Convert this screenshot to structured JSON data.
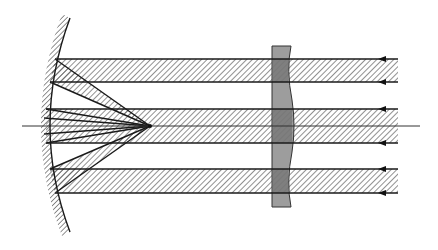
{
  "diagram": {
    "title": "",
    "type": "optics-ray-diagram",
    "colors": {
      "background": "#ffffff",
      "line": "#1a1a1a",
      "hatch": "#555555",
      "lens_fill": "#8c8c8c",
      "axis": "#333333"
    },
    "optical_axis": {
      "y": 126,
      "x_start": 22,
      "x_end": 420
    },
    "focus_point": {
      "x": 150,
      "y": 126
    },
    "mirror": {
      "label": "concave-mirror",
      "hatched_back": true
    },
    "lens": {
      "label": "corrector-plate",
      "x": 272,
      "width": 20,
      "y_top": 46,
      "y_bottom": 207
    },
    "beams": [
      {
        "name": "upper-beam",
        "y_top": 59,
        "y_bottom": 82
      },
      {
        "name": "central-beam",
        "y_top": 109,
        "y_bottom": 143
      },
      {
        "name": "lower-beam",
        "y_top": 169,
        "y_bottom": 193
      }
    ],
    "arrow_direction": "right-to-left",
    "labels": []
  }
}
